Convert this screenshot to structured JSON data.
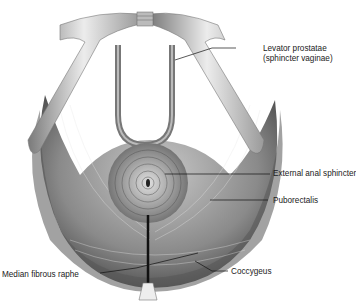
{
  "figure": {
    "labels": [
      {
        "id": "levator",
        "line1": "Levator prostatae",
        "line2": "(sphincter vaginae)"
      },
      {
        "id": "ext_anal",
        "text": "External anal sphincter"
      },
      {
        "id": "puborectalis",
        "text": "Puborectalis"
      },
      {
        "id": "median_raphe",
        "text": "Median fibrous raphe"
      },
      {
        "id": "coccygeus",
        "text": "Coccygeus"
      }
    ],
    "colors": {
      "muscle_dark": "#3a3a3a",
      "muscle_mid": "#8a8a8a",
      "bone": "#d6d6d6",
      "leader": "#111111"
    }
  }
}
